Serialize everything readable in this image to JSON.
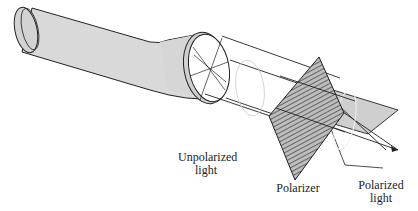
{
  "diagram": {
    "components": [
      {
        "id": "flashlight",
        "name": "Flashlight",
        "role": "light source"
      },
      {
        "id": "unpolarized-beam",
        "name": "Unpolarized light beam",
        "role": "light with random oscillation directions"
      },
      {
        "id": "polarizer",
        "name": "Polarizer",
        "role": "hatched filter plate"
      },
      {
        "id": "polarized-plane",
        "name": "Polarized light",
        "role": "single oscillation plane"
      }
    ],
    "labels": {
      "unpolarized_line1": "Unpolarized",
      "unpolarized_line2": "light",
      "polarizer": "Polarizer",
      "polarized_line1": "Polarized",
      "polarized_line2": "light"
    },
    "colors": {
      "body_fill": "#d9d9d9",
      "outline": "#222222",
      "plane_fill": "#cfcfcf",
      "hatch": "#333333",
      "background": "#ffffff"
    }
  }
}
